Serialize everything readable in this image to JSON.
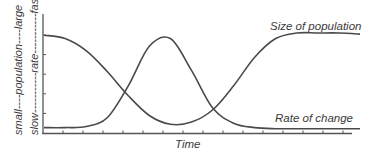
{
  "chart_data": {
    "type": "line",
    "title": "",
    "xlabel": "Time",
    "ylabel_population": "small----population----large",
    "ylabel_rate": "slow-----------rate-----------fast",
    "grid": false,
    "legend": "inline labels at right end of curves",
    "x": [
      0,
      1,
      2,
      3,
      4,
      5,
      6,
      7,
      8,
      9,
      10,
      11,
      12,
      13,
      14,
      15
    ],
    "series": [
      {
        "name": "Size of population",
        "label_position": "upper-right",
        "values": [
          0.88,
          0.85,
          0.74,
          0.55,
          0.33,
          0.15,
          0.07,
          0.09,
          0.2,
          0.42,
          0.68,
          0.85,
          0.9,
          0.9,
          0.9,
          0.89
        ]
      },
      {
        "name": "Rate of change",
        "label_position": "lower-right",
        "values": [
          0.04,
          0.04,
          0.05,
          0.13,
          0.42,
          0.78,
          0.85,
          0.56,
          0.22,
          0.08,
          0.04,
          0.03,
          0.03,
          0.03,
          0.03,
          0.03
        ]
      }
    ],
    "xlim": [
      0,
      15
    ],
    "ylim": [
      0,
      1
    ],
    "x_ticks_count": 15,
    "y_ticks_count": 5
  },
  "labels": {
    "population_axis": "small----population----large",
    "rate_axis": "slow-----------rate-----------fast",
    "time": "Time",
    "size_of_population": "Size of population",
    "rate_of_change": "Rate of change"
  },
  "colors": {
    "line": "#4a4a4a",
    "axis": "#555555",
    "text": "#3a3a3a"
  }
}
